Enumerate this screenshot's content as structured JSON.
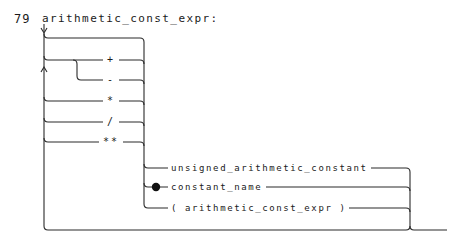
{
  "rule": {
    "number": "79",
    "name": "arithmetic_const_expr:"
  },
  "operators": [
    {
      "symbol": "+"
    },
    {
      "symbol": "-"
    },
    {
      "symbol": "*"
    },
    {
      "symbol": "/"
    },
    {
      "symbol": "**"
    }
  ],
  "alternatives": [
    {
      "label": "unsigned_arithmetic_constant"
    },
    {
      "label": "constant_name",
      "marker": "filled-dot"
    },
    {
      "label": "( arithmetic_const_expr )"
    }
  ]
}
